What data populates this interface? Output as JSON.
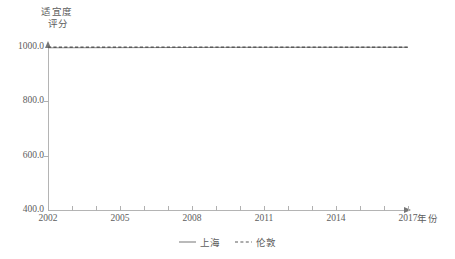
{
  "chart_data": {
    "type": "line",
    "title": "",
    "subtitle": "",
    "xlabel": "年份",
    "ylabel": "适宜度评分",
    "ylabel_line1": "适宜度",
    "ylabel_line2": "评分",
    "grid": false,
    "legend_position": "bottom-center",
    "xlim": [
      2002,
      2017
    ],
    "ylim": [
      400.0,
      1000.0
    ],
    "ytick_labels": [
      "1000.0",
      "800.0",
      "600.0",
      "400.0"
    ],
    "ytick_values": [
      1000.0,
      800.0,
      600.0,
      400.0
    ],
    "xtick_labels": [
      "2002",
      "2005",
      "2008",
      "2011",
      "2014",
      "2017"
    ],
    "xtick_values": [
      2002,
      2005,
      2008,
      2011,
      2014,
      2017
    ],
    "x": [
      2002,
      2003,
      2004,
      2005,
      2006,
      2007,
      2008,
      2009,
      2010,
      2011,
      2012,
      2013,
      2014,
      2015,
      2016,
      2017
    ],
    "series": [
      {
        "name": "上海",
        "style": "solid",
        "color": "#8c8c8c",
        "values": [
          997.0,
          997.2,
          997.4,
          997.6,
          997.8,
          998.0,
          998.2,
          998.6,
          998.7,
          998.8,
          998.8,
          998.9,
          998.9,
          999.0,
          999.0,
          999.0
        ]
      },
      {
        "name": "伦敦",
        "style": "dashed",
        "color": "#5a5a5a",
        "values": [
          999.0,
          999.0,
          999.0,
          999.0,
          999.0,
          999.0,
          999.0,
          999.0,
          999.0,
          999.0,
          999.0,
          999.0,
          999.0,
          999.0,
          999.0,
          999.0
        ]
      }
    ],
    "annotations": []
  },
  "legend": {
    "items": [
      {
        "label": "上海",
        "style": "solid"
      },
      {
        "label": "伦敦",
        "style": "dashed"
      }
    ]
  },
  "colors": {
    "background": "#ffffff",
    "axis": "#b4b4b4",
    "text": "#5d5d5d",
    "series_solid": "#8c8c8c",
    "series_dashed": "#5a5a5a"
  }
}
